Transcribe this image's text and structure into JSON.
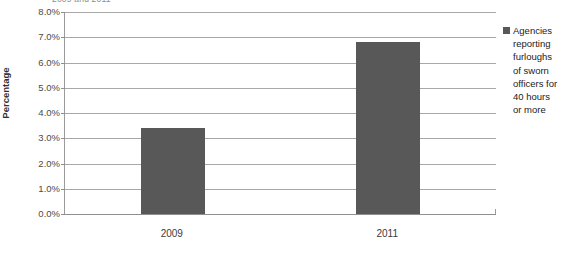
{
  "chart_data": {
    "type": "bar",
    "title": "",
    "title_remnant": "2009 and 2011",
    "categories": [
      "2009",
      "2011"
    ],
    "values": [
      3.4,
      6.8
    ],
    "series": [
      {
        "name": "Agencies reporting furloughs of sworn officers for 40 hours or more",
        "values": [
          3.4,
          6.8
        ]
      }
    ],
    "xlabel": "",
    "ylabel": "Percentage",
    "ylim": [
      0.0,
      8.0
    ],
    "ytick_step": 1.0,
    "ytick_labels": [
      "0.0%",
      "1.0%",
      "2.0%",
      "3.0%",
      "4.0%",
      "5.0%",
      "6.0%",
      "7.0%",
      "8.0%"
    ],
    "ytick_values": [
      0.0,
      1.0,
      2.0,
      3.0,
      4.0,
      5.0,
      6.0,
      7.0,
      8.0
    ],
    "value_format": "percent",
    "grid": true,
    "grid_axis": "y",
    "legend_position": "right",
    "bar_color": "#585858",
    "gridline_color": "#a8a8a8",
    "axis_color": "#8f8f8f",
    "background": "#ffffff"
  },
  "legend": {
    "entries": [
      {
        "marker": "square-marker-icon",
        "color": "#585858",
        "label": "Agencies\nreporting\nfurloughs\nof sworn\nofficers for\n40 hours\nor more"
      }
    ]
  },
  "axis": {
    "y_title": "Percentage"
  }
}
